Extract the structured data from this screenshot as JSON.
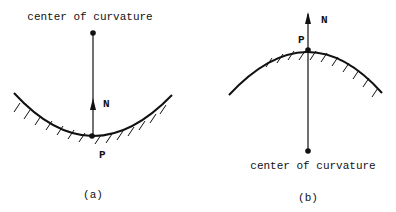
{
  "figure_a": {
    "caption": "(a)",
    "center_label": "center of curvature",
    "normal_label": "N",
    "point_label": "P"
  },
  "figure_b": {
    "caption": "(b)",
    "center_label": "center of curvature",
    "normal_label": "N",
    "point_label": "P"
  }
}
